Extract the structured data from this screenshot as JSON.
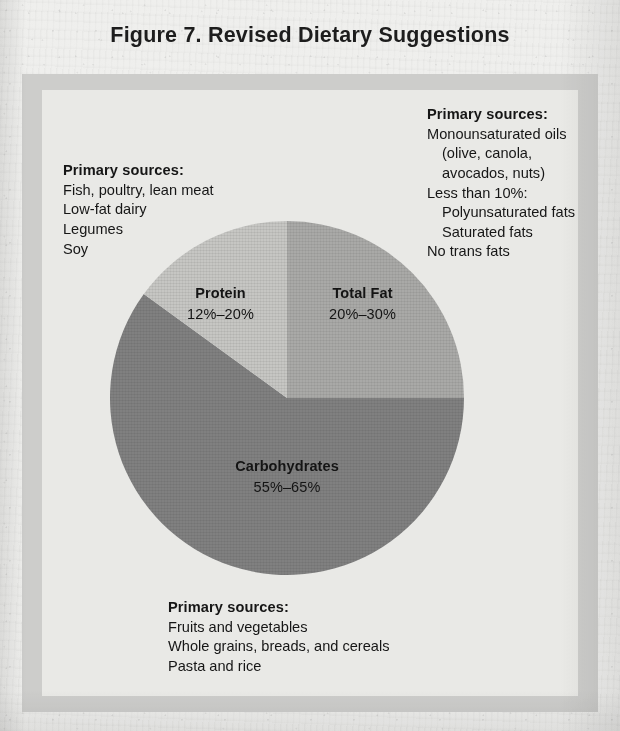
{
  "figure": {
    "title": "Figure 7. Revised Dietary Suggestions"
  },
  "colors": {
    "page_background": "#efefed",
    "frame_border": "#cdcdcb",
    "panel_background": "#e9e9e6",
    "slice_total_fat": "#a9a9a7",
    "slice_protein": "#c6c6c3",
    "slice_carbohydrates": "#808080",
    "text": "#161616"
  },
  "chart_data": {
    "type": "pie",
    "title": "Figure 7. Revised Dietary Suggestions",
    "xlabel": "",
    "ylabel": "",
    "legend_position": "none",
    "grid": false,
    "categories": [
      "Total Fat",
      "Carbohydrates",
      "Protein"
    ],
    "values": [
      25,
      60,
      15
    ],
    "value_labels": [
      "20%–30%",
      "55%–65%",
      "12%–20%"
    ],
    "ranges": [
      {
        "name": "Total Fat",
        "low": 20,
        "high": 30,
        "unit": "%"
      },
      {
        "name": "Carbohydrates",
        "low": 55,
        "high": 65,
        "unit": "%"
      },
      {
        "name": "Protein",
        "low": 12,
        "high": 20,
        "unit": "%"
      }
    ],
    "slice_colors": [
      "#a9a9a7",
      "#808080",
      "#c6c6c3"
    ],
    "start_angle_deg": 0,
    "direction": "clockwise",
    "slices": [
      {
        "label": "Total Fat",
        "value_label": "20%–30%",
        "share": 25,
        "color": "#a9a9a7"
      },
      {
        "label": "Carbohydrates",
        "value_label": "55%–65%",
        "share": 60,
        "color": "#808080"
      },
      {
        "label": "Protein",
        "value_label": "12%–20%",
        "share": 15,
        "color": "#c6c6c3"
      }
    ]
  },
  "slice_labels": {
    "protein": {
      "name": "Protein",
      "value": "12%–20%"
    },
    "total_fat": {
      "name": "Total Fat",
      "value": "20%–30%"
    },
    "carbohydrates": {
      "name": "Carbohydrates",
      "value": "55%–65%"
    }
  },
  "notes": {
    "protein": {
      "heading": "Primary sources:",
      "lines": [
        "Fish, poultry, lean meat",
        "Low-fat dairy",
        "Legumes",
        "Soy"
      ]
    },
    "total_fat": {
      "heading": "Primary sources:",
      "lines": [
        "Monounsaturated oils",
        "(olive, canola,",
        "avocados, nuts)",
        "Less than 10%:",
        "Polyunsaturated fats",
        "Saturated fats",
        "No trans fats"
      ]
    },
    "carbohydrates": {
      "heading": "Primary sources:",
      "lines": [
        "Fruits and vegetables",
        "Whole grains, breads, and cereals",
        "Pasta and rice"
      ]
    }
  }
}
